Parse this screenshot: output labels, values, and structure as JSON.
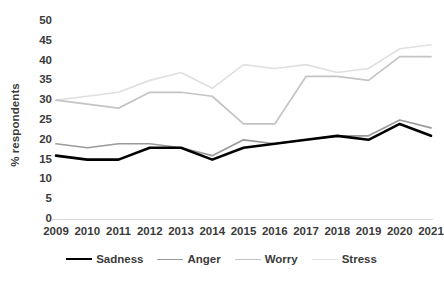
{
  "chart_data": {
    "type": "line",
    "title": "",
    "xlabel": "",
    "ylabel": "% respondents",
    "categories": [
      "2009",
      "2010",
      "2011",
      "2012",
      "2013",
      "2014",
      "2015",
      "2016",
      "2017",
      "2018",
      "2019",
      "2020",
      "2021"
    ],
    "ylim": [
      0,
      50
    ],
    "yticks": [
      0,
      5,
      10,
      15,
      20,
      25,
      30,
      35,
      40,
      45,
      50
    ],
    "grid": false,
    "legend_position": "bottom",
    "series": [
      {
        "name": "Sadness",
        "color": "#000000",
        "width": 2.6,
        "values": [
          16,
          15,
          15,
          18,
          18,
          15,
          18,
          19,
          20,
          21,
          20,
          24,
          21
        ]
      },
      {
        "name": "Anger",
        "color": "#9a9a9a",
        "width": 1.7,
        "values": [
          19,
          18,
          19,
          19,
          18,
          16,
          20,
          19,
          20,
          21,
          21,
          25,
          23
        ]
      },
      {
        "name": "Worry",
        "color": "#c4c4c4",
        "width": 1.7,
        "values": [
          30,
          29,
          28,
          32,
          32,
          31,
          24,
          24,
          36,
          36,
          35,
          41,
          41
        ]
      },
      {
        "name": "Stress",
        "color": "#e0e0e0",
        "width": 1.7,
        "values": [
          30,
          31,
          32,
          35,
          37,
          33,
          39,
          38,
          39,
          37,
          38,
          43,
          44
        ]
      }
    ]
  },
  "axis": {
    "y_title": "% respondents",
    "y_tick_labels": [
      "0",
      "5",
      "10",
      "15",
      "20",
      "25",
      "30",
      "35",
      "40",
      "45",
      "50"
    ],
    "x_tick_labels": [
      "2009",
      "2010",
      "2011",
      "2012",
      "2013",
      "2014",
      "2015",
      "2016",
      "2017",
      "2018",
      "2019",
      "2020",
      "2021"
    ],
    "baseline_color": "#d9d9d9",
    "text_color": "#3b3b3b"
  },
  "legend": {
    "items": [
      {
        "label": "Sadness",
        "color": "#000000",
        "width": 2.6
      },
      {
        "label": "Anger",
        "color": "#9a9a9a",
        "width": 1.7
      },
      {
        "label": "Worry",
        "color": "#c4c4c4",
        "width": 1.7
      },
      {
        "label": "Stress",
        "color": "#e0e0e0",
        "width": 1.7
      }
    ]
  }
}
